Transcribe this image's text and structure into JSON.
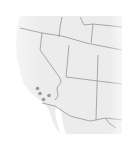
{
  "map": {
    "region": "Western United States",
    "land_color": "#ececec",
    "border_color": "#8a8a8a",
    "marker_color": "#9a9a9a",
    "states_visible": [
      "California",
      "Nevada",
      "Oregon",
      "Idaho",
      "Utah",
      "Arizona",
      "Wyoming",
      "Colorado",
      "New Mexico"
    ],
    "markers": [
      {
        "x": 37.5,
        "y": 88.5
      },
      {
        "x": 40,
        "y": 93.5
      },
      {
        "x": 49,
        "y": 95.5
      },
      {
        "x": 43.5,
        "y": 99.5
      }
    ]
  }
}
